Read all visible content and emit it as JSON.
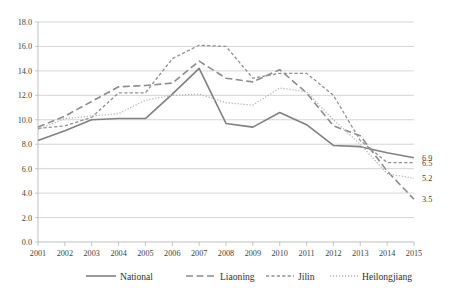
{
  "chart_data": {
    "type": "line",
    "title": "",
    "xlabel": "",
    "ylabel": "",
    "x": [
      2001,
      2002,
      2003,
      2004,
      2005,
      2006,
      2007,
      2008,
      2009,
      2010,
      2011,
      2012,
      2013,
      2014,
      2015
    ],
    "xtick_labels": [
      "2001",
      "2002",
      "2003",
      "2004",
      "2005",
      "2006",
      "2007",
      "2008",
      "2009",
      "2010",
      "2011",
      "2012",
      "2013",
      "2014",
      "2015"
    ],
    "ytick_labels": [
      "0.0",
      "2.0",
      "4.0",
      "6.0",
      "8.0",
      "10.0",
      "12.0",
      "14.0",
      "16.0",
      "18.0"
    ],
    "ytick_values": [
      0.0,
      2.0,
      4.0,
      6.0,
      8.0,
      10.0,
      12.0,
      14.0,
      16.0,
      18.0
    ],
    "ylim": [
      0.0,
      18.0
    ],
    "grid": true,
    "legend_position": "bottom",
    "series": [
      {
        "name": "National",
        "style": "solid",
        "color": "#808080",
        "width": 1.6,
        "values": [
          8.3,
          9.1,
          10.0,
          10.1,
          10.1,
          12.1,
          14.2,
          9.7,
          9.4,
          10.6,
          9.6,
          7.9,
          7.8,
          7.3,
          6.9
        ],
        "end_label": "6.9"
      },
      {
        "name": "Liaoning",
        "style": "long-dash",
        "color": "#8c8c8c",
        "width": 1.6,
        "values": [
          9.4,
          10.3,
          11.5,
          12.7,
          12.8,
          13.0,
          14.8,
          13.4,
          13.1,
          14.1,
          12.2,
          9.5,
          8.7,
          5.8,
          3.5
        ],
        "end_label": "3.5"
      },
      {
        "name": "Jilin",
        "style": "short-dash",
        "color": "#919191",
        "width": 1.3,
        "values": [
          9.3,
          9.5,
          10.2,
          12.2,
          12.2,
          15.0,
          16.1,
          16.0,
          13.4,
          13.8,
          13.8,
          12.0,
          8.3,
          6.5,
          6.5
        ],
        "end_label": "6.5"
      },
      {
        "name": "Heilongjiang",
        "style": "dotted",
        "color": "#b4b4b4",
        "width": 1.3,
        "values": [
          9.2,
          10.1,
          10.3,
          10.5,
          11.6,
          12.0,
          12.1,
          11.4,
          11.2,
          12.6,
          12.3,
          10.0,
          8.0,
          5.6,
          5.2
        ],
        "end_label": "5.2"
      }
    ]
  },
  "legend": {
    "items": [
      {
        "label": "National"
      },
      {
        "label": "Liaoning"
      },
      {
        "label": "Jilin"
      },
      {
        "label": "Heilongjiang"
      }
    ]
  }
}
